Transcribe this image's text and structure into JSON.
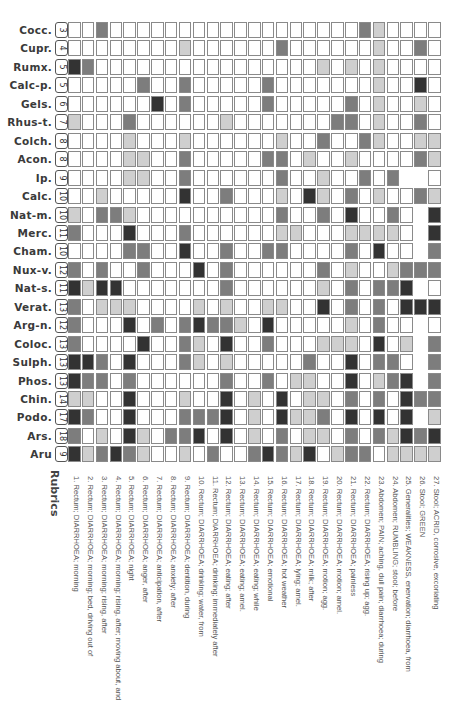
{
  "rubrics_title": "Rubrics",
  "shade_colors": {
    "0": "#ffffff",
    "1": "#cfcfcf",
    "2": "#7d7d7d",
    "3": "#333333"
  },
  "remedies": [
    {
      "name": "Cocc.",
      "count": "3",
      "cells": [
        0,
        0,
        2,
        0,
        0,
        0,
        0,
        0,
        0,
        0,
        0,
        0,
        0,
        0,
        0,
        0,
        0,
        0,
        0,
        0,
        0,
        2,
        1,
        0,
        0,
        0,
        0
      ]
    },
    {
      "name": "Cupr.",
      "count": "4",
      "cells": [
        0,
        0,
        0,
        0,
        0,
        0,
        0,
        0,
        1,
        0,
        0,
        0,
        0,
        0,
        0,
        2,
        0,
        0,
        0,
        0,
        0,
        0,
        1,
        0,
        0,
        2,
        0
      ]
    },
    {
      "name": "Rumx.",
      "count": "5",
      "cells": [
        3,
        2,
        0,
        0,
        0,
        0,
        0,
        0,
        0,
        0,
        0,
        0,
        0,
        0,
        0,
        0,
        0,
        0,
        1,
        0,
        1,
        0,
        1,
        0,
        0,
        0,
        0
      ]
    },
    {
      "name": "Calc-p.",
      "count": "5",
      "cells": [
        0,
        0,
        0,
        0,
        0,
        2,
        0,
        0,
        2,
        0,
        0,
        0,
        0,
        0,
        2,
        0,
        0,
        0,
        0,
        0,
        0,
        0,
        1,
        0,
        0,
        3,
        0
      ]
    },
    {
      "name": "Gels.",
      "count": "6",
      "cells": [
        0,
        0,
        0,
        0,
        0,
        0,
        3,
        0,
        2,
        0,
        0,
        0,
        0,
        0,
        2,
        0,
        0,
        0,
        0,
        0,
        2,
        0,
        1,
        0,
        0,
        1,
        0
      ]
    },
    {
      "name": "Rhus-t.",
      "count": "7",
      "cells": [
        1,
        0,
        0,
        0,
        2,
        0,
        0,
        0,
        0,
        0,
        0,
        1,
        0,
        0,
        0,
        0,
        0,
        0,
        0,
        2,
        2,
        0,
        1,
        0,
        0,
        2,
        0
      ]
    },
    {
      "name": "Colch.",
      "count": "8",
      "cells": [
        0,
        0,
        0,
        0,
        1,
        0,
        0,
        0,
        1,
        0,
        0,
        0,
        0,
        0,
        0,
        1,
        0,
        0,
        2,
        0,
        0,
        2,
        1,
        0,
        0,
        1,
        1
      ]
    },
    {
      "name": "Acon.",
      "count": "8",
      "cells": [
        0,
        0,
        0,
        0,
        1,
        1,
        0,
        0,
        2,
        0,
        0,
        0,
        0,
        0,
        2,
        2,
        0,
        1,
        0,
        0,
        1,
        0,
        0,
        0,
        0,
        2,
        1
      ]
    },
    {
      "name": "Ip.",
      "count": "9",
      "cells": [
        0,
        0,
        0,
        0,
        1,
        1,
        0,
        0,
        2,
        0,
        0,
        0,
        0,
        0,
        0,
        2,
        0,
        0,
        1,
        0,
        0,
        2,
        0,
        2,
        -1,
        -1,
        0
      ]
    },
    {
      "name": "Calc.",
      "count": "10",
      "cells": [
        0,
        0,
        1,
        0,
        0,
        0,
        0,
        0,
        3,
        0,
        0,
        2,
        0,
        0,
        0,
        1,
        0,
        3,
        1,
        0,
        2,
        0,
        1,
        0,
        0,
        2,
        1
      ]
    },
    {
      "name": "Nat-m.",
      "count": "10",
      "cells": [
        1,
        0,
        2,
        2,
        1,
        0,
        0,
        0,
        0,
        0,
        0,
        0,
        0,
        0,
        0,
        2,
        0,
        0,
        2,
        0,
        3,
        0,
        0,
        2,
        0,
        -1,
        3
      ]
    },
    {
      "name": "Merc.",
      "count": "11",
      "cells": [
        2,
        0,
        0,
        0,
        3,
        0,
        0,
        0,
        2,
        0,
        0,
        0,
        0,
        0,
        0,
        1,
        1,
        0,
        0,
        0,
        1,
        1,
        1,
        1,
        0,
        -1,
        3
      ]
    },
    {
      "name": "Cham.",
      "count": "10",
      "cells": [
        0,
        0,
        0,
        0,
        2,
        2,
        0,
        0,
        3,
        0,
        0,
        2,
        0,
        0,
        2,
        2,
        0,
        0,
        0,
        0,
        2,
        0,
        3,
        0,
        0,
        -1,
        2
      ]
    },
    {
      "name": "Nux-v.",
      "count": "12",
      "cells": [
        2,
        0,
        2,
        0,
        0,
        2,
        0,
        0,
        0,
        3,
        0,
        2,
        0,
        0,
        0,
        0,
        0,
        0,
        2,
        0,
        1,
        0,
        0,
        1,
        2,
        2,
        2
      ]
    },
    {
      "name": "Nat-s.",
      "count": "11",
      "cells": [
        3,
        1,
        3,
        3,
        0,
        0,
        0,
        0,
        0,
        0,
        0,
        2,
        0,
        0,
        0,
        0,
        0,
        0,
        1,
        0,
        2,
        0,
        2,
        2,
        3,
        -1,
        0
      ]
    },
    {
      "name": "Verat.",
      "count": "13",
      "cells": [
        2,
        0,
        1,
        1,
        1,
        0,
        0,
        0,
        0,
        1,
        0,
        1,
        0,
        0,
        1,
        1,
        0,
        0,
        3,
        0,
        2,
        0,
        2,
        0,
        3,
        3,
        3
      ]
    },
    {
      "name": "Arg-n.",
      "count": "12",
      "cells": [
        2,
        0,
        0,
        0,
        3,
        0,
        2,
        0,
        2,
        3,
        2,
        2,
        1,
        0,
        3,
        0,
        0,
        0,
        0,
        0,
        1,
        0,
        2,
        0,
        0,
        -1,
        0
      ]
    },
    {
      "name": "Coloc.",
      "count": "13",
      "cells": [
        2,
        0,
        0,
        0,
        0,
        3,
        0,
        0,
        2,
        1,
        0,
        3,
        0,
        0,
        2,
        0,
        0,
        0,
        1,
        1,
        1,
        0,
        3,
        0,
        1,
        -1,
        2
      ]
    },
    {
      "name": "Sulph.",
      "count": "13",
      "cells": [
        3,
        3,
        2,
        0,
        3,
        0,
        0,
        0,
        2,
        1,
        0,
        1,
        0,
        0,
        0,
        0,
        0,
        2,
        0,
        0,
        3,
        0,
        2,
        2,
        0,
        -1,
        2
      ]
    },
    {
      "name": "Phos.",
      "count": "13",
      "cells": [
        3,
        2,
        2,
        0,
        2,
        0,
        0,
        0,
        0,
        0,
        0,
        2,
        0,
        0,
        2,
        0,
        1,
        1,
        0,
        0,
        3,
        0,
        1,
        2,
        3,
        -1,
        2
      ]
    },
    {
      "name": "Chin.",
      "count": "14",
      "cells": [
        1,
        1,
        0,
        0,
        3,
        0,
        0,
        0,
        1,
        0,
        0,
        3,
        0,
        1,
        0,
        3,
        0,
        1,
        1,
        0,
        2,
        0,
        2,
        0,
        3,
        2,
        2
      ]
    },
    {
      "name": "Podo.",
      "count": "17",
      "cells": [
        3,
        2,
        0,
        0,
        3,
        0,
        0,
        0,
        2,
        2,
        2,
        3,
        0,
        1,
        0,
        3,
        1,
        1,
        2,
        0,
        3,
        0,
        3,
        0,
        3,
        -1,
        1
      ]
    },
    {
      "name": "Ars.",
      "count": "18",
      "cells": [
        2,
        0,
        1,
        0,
        3,
        1,
        0,
        2,
        2,
        3,
        0,
        3,
        0,
        1,
        0,
        2,
        0,
        1,
        1,
        0,
        2,
        0,
        2,
        1,
        3,
        2,
        3
      ]
    },
    {
      "name": "Aru",
      "count": "9",
      "cells": [
        3,
        1,
        2,
        3,
        2,
        1,
        0,
        0,
        1,
        0,
        2,
        0,
        0,
        2,
        3,
        2,
        1,
        3,
        0,
        1,
        2,
        2,
        0,
        1,
        1,
        1,
        1
      ]
    }
  ],
  "rubrics": [
    "1. Rectum; DIARRHOEA; morning",
    "2. Rectum; DIARRHOEA; morning; bed, driving out of",
    "3. Rectum; DIARRHOEA; morning; rising, after",
    "4. Rectum; DIARRHOEA; morning; rising, after; moving about, and",
    "5. Rectum; DIARRHOEA; night",
    "6. Rectum; DIARRHOEA; anger, after",
    "7. Rectum; DIARRHOEA; anticipation, after",
    "8. Rectum; DIARRHOEA; anxiety; after",
    "9. Rectum; DIARRHOEA; dentition, during",
    "10. Rectum; DIARRHOEA; drinking; water, from",
    "11. Rectum; DIARRHOEA; drinking; immediately after",
    "12. Rectum; DIARRHOEA; eating; after",
    "13. Rectum; DIARRHOEA; eating; amel.",
    "14. Rectum; DIARRHOEA; eating; while",
    "15. Rectum; DIARRHOEA; emotional",
    "16. Rectum; DIARRHOEA; hot weather",
    "17. Rectum; DIARRHOEA; lying; amel.",
    "18. Rectum; DIARRHOEA; milk; after",
    "19. Rectum; DIARRHOEA; motion; agg.",
    "20. Rectum; DIARRHOEA; motion; amel.",
    "21. Rectum; DIARRHOEA; painless",
    "22. Rectum; DIARRHOEA; rising up; agg.",
    "23. Abdomen; PAIN; aching, dull pain; diarrhoea; during",
    "24. Abdomen; RUMBLING; stool; before",
    "25. Generalities; WEAKNESS, enervation; diarrhoea, from",
    "26. Stool; GREEN",
    "27. Stool; ACRID, corrosive, excoriating"
  ]
}
